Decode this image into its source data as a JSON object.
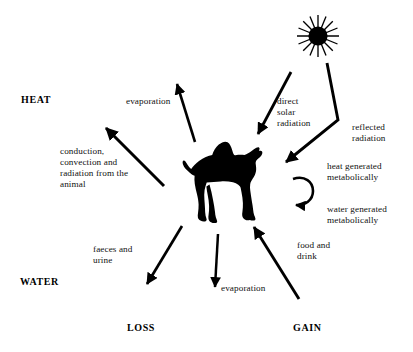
{
  "diagram": {
    "background_color": "#ffffff",
    "ink_color": "#000000",
    "axis_labels": {
      "heat": "HEAT",
      "water": "WATER",
      "loss": "LOSS",
      "gain": "GAIN"
    },
    "center_icon": "camel-silhouette",
    "source_icon": "sun-icon",
    "flows": [
      {
        "id": "evaporation-heat",
        "label": "evaporation",
        "category": "heat",
        "direction": "loss",
        "arrow": "outward-up-left"
      },
      {
        "id": "conduction-convection-radiation",
        "label": "conduction,\nconvection and\nradiation from the\nanimal",
        "category": "heat",
        "direction": "loss",
        "arrow": "outward-up-left"
      },
      {
        "id": "direct-solar-radiation",
        "label": "direct\nsolar\nradiation",
        "category": "heat",
        "direction": "gain",
        "arrow": "inward-down-left"
      },
      {
        "id": "reflected-radiation",
        "label": "reflected\nradiation",
        "category": "heat",
        "direction": "gain",
        "arrow": "bent-inward-down-left"
      },
      {
        "id": "heat-generated-metabolically",
        "label": "heat generated\nmetabolically",
        "category": "heat",
        "direction": "gain",
        "arrow": "circular-loop"
      },
      {
        "id": "water-generated-metabolically",
        "label": "water generated\nmetabolically",
        "category": "water",
        "direction": "gain",
        "arrow": "circular-loop"
      },
      {
        "id": "food-and-drink",
        "label": "food and\ndrink",
        "category": "water",
        "direction": "gain",
        "arrow": "inward-up-left"
      },
      {
        "id": "faeces-and-urine",
        "label": "faeces and\nurine",
        "category": "water",
        "direction": "loss",
        "arrow": "outward-down-left"
      },
      {
        "id": "evaporation-water",
        "label": "evaporation",
        "category": "water",
        "direction": "loss",
        "arrow": "outward-down"
      }
    ]
  }
}
